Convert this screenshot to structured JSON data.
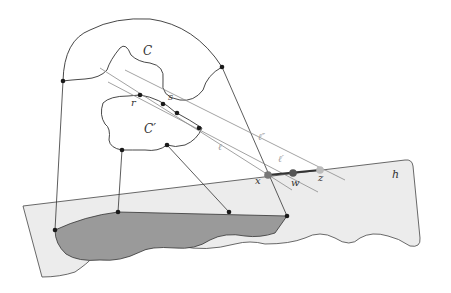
{
  "diagram": {
    "labels": {
      "C": "C",
      "C_prime": "C′",
      "r": "r",
      "s": "s",
      "l": "ℓ",
      "l_prime": "ℓ′",
      "l_double_prime": "ℓ″",
      "x": "x",
      "w": "w",
      "z": "z",
      "h": "h"
    },
    "colors": {
      "plane_fill": "#ececec",
      "shadow_fill": "#9a9a9a",
      "stroke": "#333333",
      "line_light": "#8a8a8a",
      "point_dark": "#1a1a1a",
      "point_x": "#777777",
      "point_w": "#555555",
      "point_z": "#bbbbbb"
    }
  }
}
